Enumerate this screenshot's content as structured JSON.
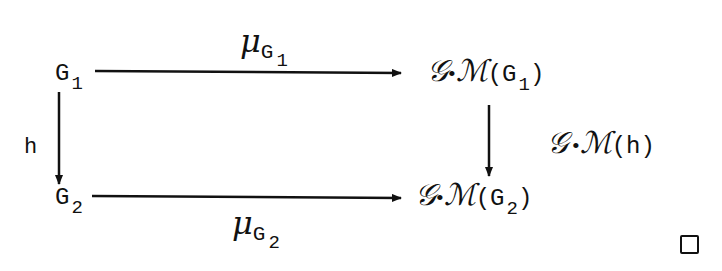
{
  "diagram": {
    "type": "commutative-square",
    "nodes": {
      "top_left": {
        "base": "G",
        "sub": "1"
      },
      "bottom_left": {
        "base": "G",
        "sub": "2"
      },
      "top_right": {
        "functor_g": "𝒢",
        "dot": "•",
        "functor_m": "ℳ",
        "open": "(",
        "base": "G",
        "sub": "1",
        "close": ")"
      },
      "bottom_right": {
        "functor_g": "𝒢",
        "dot": "•",
        "functor_m": "ℳ",
        "open": "(",
        "base": "G",
        "sub": "2",
        "close": ")"
      }
    },
    "arrows": {
      "top": {
        "symbol": "μ",
        "sub_base": "G",
        "sub_index": "1",
        "from": "G1",
        "to": "G·M(G1)"
      },
      "bottom": {
        "symbol": "μ",
        "sub_base": "G",
        "sub_index": "2",
        "from": "G2",
        "to": "G·M(G2)"
      },
      "left": {
        "label": "h",
        "from": "G1",
        "to": "G2"
      },
      "right": {
        "functor_g": "𝒢",
        "dot": "•",
        "functor_m": "ℳ",
        "arg": "(h)",
        "from": "G·M(G1)",
        "to": "G·M(G2)"
      }
    },
    "end_marker": "□"
  }
}
